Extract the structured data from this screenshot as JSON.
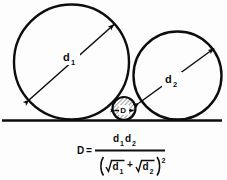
{
  "diagram": {
    "ground_line_label": "ground-line",
    "circles": {
      "large": {
        "name": "circle-d1",
        "diameter_label": "d",
        "diameter_subscript": "1",
        "cx": 71.5,
        "cy": 62.0,
        "r": 57.5
      },
      "right": {
        "name": "circle-d2",
        "diameter_label": "d",
        "diameter_subscript": "2",
        "cx": 177.5,
        "cy": 75.5,
        "r": 44.0
      },
      "small": {
        "name": "circle-D",
        "diameter_label": "D",
        "cx": 124.0,
        "cy": 108.5,
        "r": 11.5
      }
    },
    "arrows": {
      "d1": {
        "x1": 29.0,
        "y1": 100.0,
        "x2": 114.0,
        "y2": 24.5
      },
      "d2": {
        "x1": 139.0,
        "y1": 103.0,
        "x2": 214.0,
        "y2": 48.5
      },
      "D": {
        "x1": 114.5,
        "y1": 110.5,
        "x2": 133.5,
        "y2": 110.5
      }
    },
    "ground": {
      "x1": 2.0,
      "y1": 120.5,
      "x2": 222.0,
      "y2": 120.5
    }
  },
  "formula": {
    "name": "diameter-formula",
    "lhs": "D",
    "equals": "=",
    "numerator": {
      "term1_base": "d",
      "term1_sub": "1",
      "term2_base": "d",
      "term2_sub": "2"
    },
    "denominator": {
      "open_paren": "(",
      "radical1_base": "d",
      "radical1_sub": "1",
      "plus": "+",
      "radical2_base": "d",
      "radical2_sub": "2",
      "close_paren": ")",
      "exponent": "2"
    },
    "plain_text": "D = d1*d2 / (sqrt(d1) + sqrt(d2))^2"
  },
  "colors": {
    "ink": "#0d0d0d",
    "background": "#fdfdfd",
    "hatch": "#4a4a4a"
  }
}
